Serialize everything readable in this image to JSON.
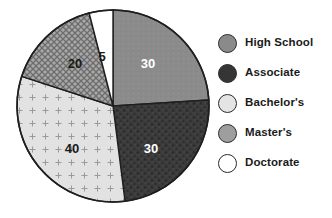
{
  "chart_data": {
    "type": "pie",
    "title": "",
    "labels": [
      "High School",
      "Associate",
      "Bachelor's",
      "Master's",
      "Doctorate"
    ],
    "values": [
      30,
      30,
      40,
      20,
      5
    ],
    "value_labels": [
      "30",
      "30",
      "40",
      "20",
      "5"
    ],
    "total": 125,
    "legend_position": "right",
    "grid": false,
    "start_angle_deg": 0,
    "direction": "clockwise",
    "slices": [
      {
        "label": "High School",
        "value": 30,
        "value_label": "30",
        "fill": "#8a8a8a",
        "pattern": "solid",
        "label_color": "#ffffff",
        "label_x": 148,
        "label_y": 63,
        "start_deg": 0,
        "end_deg": 86.4
      },
      {
        "label": "Associate",
        "value": 30,
        "value_label": "30",
        "fill": "#3a3a3a",
        "pattern": "mottled",
        "label_color": "#ffffff",
        "label_y": 148,
        "label_x": 151,
        "start_deg": 86.4,
        "end_deg": 172.8
      },
      {
        "label": "Bachelor's",
        "value": 40,
        "value_label": "40",
        "fill": "#dcdcdc",
        "pattern": "plus",
        "label_color": "#1a1a1a",
        "label_x": 72,
        "label_y": 148,
        "start_deg": 172.8,
        "end_deg": 288.0
      },
      {
        "label": "Master's",
        "value": 20,
        "value_label": "20",
        "fill": "#9e9e9e",
        "pattern": "crosshatch",
        "label_color": "#1a1a1a",
        "label_x": 75,
        "label_y": 63,
        "start_deg": 288.0,
        "end_deg": 345.6
      },
      {
        "label": "Doctorate",
        "value": 5,
        "value_label": "5",
        "fill": "#ffffff",
        "pattern": "none",
        "label_color": "#1a1a1a",
        "label_x": 102,
        "label_y": 56,
        "start_deg": 345.6,
        "end_deg": 360.0
      }
    ],
    "geometry": {
      "center_x": 113,
      "center_y": 106,
      "radius": 96
    }
  },
  "legend": {
    "items": [
      {
        "label": "High School",
        "swatch": "#8a8a8a",
        "pattern": "solid",
        "y": 4
      },
      {
        "label": "Associate",
        "swatch": "#3a3a3a",
        "pattern": "mottled",
        "y": 34
      },
      {
        "label": "Bachelor's",
        "swatch": "#e4e4e4",
        "pattern": "none",
        "y": 64
      },
      {
        "label": "Master's",
        "swatch": "#9e9e9e",
        "pattern": "crosshatch",
        "y": 94
      },
      {
        "label": "Doctorate",
        "swatch": "#ffffff",
        "pattern": "none",
        "y": 124
      }
    ]
  }
}
